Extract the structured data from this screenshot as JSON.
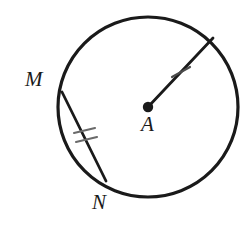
{
  "figure": {
    "name": "circle-with-radius-and-chord",
    "type": "geometry-diagram",
    "background_color": "#ffffff",
    "stroke_color": "#1a1a1a",
    "labels": {
      "center": "A",
      "chord_start": "M",
      "chord_end": "N"
    },
    "circle": {
      "name": "circle-A",
      "cx": 148,
      "cy": 107,
      "r": 90,
      "stroke_width": 3.2,
      "fill": "none"
    },
    "center_point": {
      "name": "center-dot",
      "cx": 148,
      "cy": 107,
      "r": 5.2
    },
    "radius_segment": {
      "name": "segment-A-to-circle",
      "x1": 148,
      "y1": 107,
      "x2": 213,
      "y2": 38,
      "stroke_width": 2.8,
      "tick_count": 1,
      "tick_marks": [
        {
          "x1": 172,
          "y1": 77,
          "x2": 190,
          "y2": 67
        }
      ]
    },
    "chord_segment": {
      "name": "chord-M-N",
      "x1": 62,
      "y1": 92,
      "x2": 106,
      "y2": 181,
      "stroke_width": 2.8,
      "tick_count": 2,
      "tick_marks": [
        {
          "x1": 74,
          "y1": 133,
          "x2": 95,
          "y2": 128
        },
        {
          "x1": 76,
          "y1": 142,
          "x2": 97,
          "y2": 137
        }
      ]
    },
    "label_positions": {
      "M": {
        "x": 25,
        "y": 69
      },
      "A": {
        "x": 141,
        "y": 114
      },
      "N": {
        "x": 92,
        "y": 192
      }
    }
  }
}
